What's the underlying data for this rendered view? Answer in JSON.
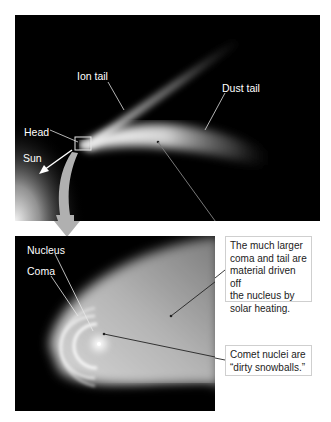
{
  "figure": {
    "top_panel": {
      "labels": {
        "ion_tail": "Ion tail",
        "dust_tail": "Dust tail",
        "head": "Head",
        "sun": "Sun"
      }
    },
    "bottom_panel": {
      "labels": {
        "nucleus": "Nucleus",
        "coma": "Coma"
      }
    },
    "callouts": {
      "coma_tail": "The much larger coma and tail are material driven off the nucleus by solar heating.",
      "coma_tail_lines": [
        "The much larger",
        "coma and tail are",
        "material driven off",
        "the nucleus by",
        "solar heating."
      ],
      "nuclei": "Comet nuclei are “dirty snowballs.”",
      "nuclei_lines": [
        "Comet nuclei are",
        "“dirty snowballs.”"
      ]
    },
    "colors": {
      "background": "#ffffff",
      "space": "#000000",
      "label_text": "#ffffff",
      "callout_text": "#222222",
      "callout_border": "#cfcfcf",
      "zoom_arrow": "#b0b0b0"
    }
  }
}
